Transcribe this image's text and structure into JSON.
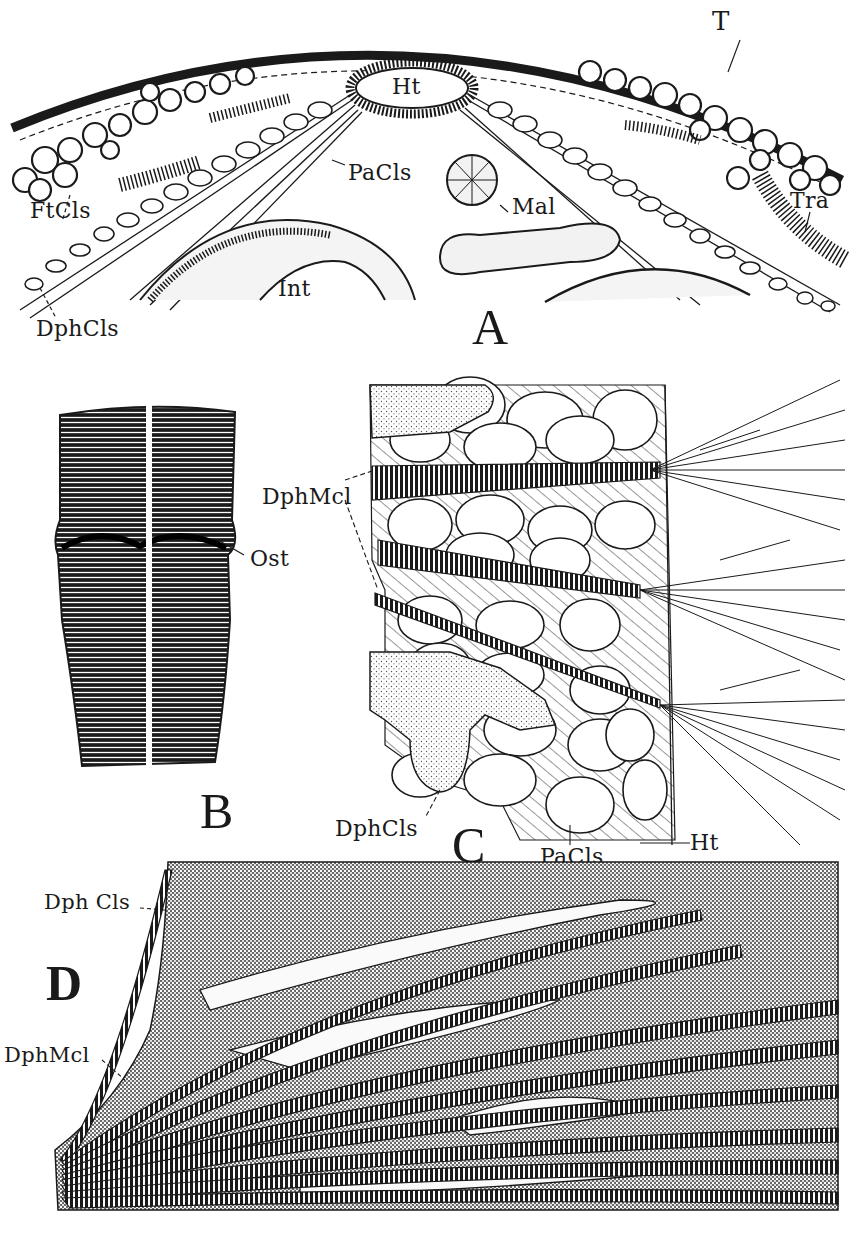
{
  "figure": {
    "panels": [
      {
        "id": "A",
        "letter": "A",
        "labels": {
          "tergum": "T",
          "heart": "Ht",
          "pericardial_cells": "PaCls",
          "fat_cells": "FtCls",
          "malpighian": "Mal",
          "tracheae": "Tra",
          "intestine": "Int",
          "diaphragm_cells": "DphCls"
        }
      },
      {
        "id": "B",
        "letter": "B",
        "labels": {
          "ostium": "Ost"
        }
      },
      {
        "id": "C",
        "letter": "C",
        "labels": {
          "diaphragm_muscle": "DphMcl",
          "diaphragm_cells": "DphCls",
          "pericardial_cells": "PaCls",
          "heart": "Ht"
        }
      },
      {
        "id": "D",
        "letter": "D",
        "labels": {
          "diaphragm_cells": "Dph Cls",
          "diaphragm_muscle": "DphMcl"
        }
      }
    ],
    "colors": {
      "ink": "#1a1a1a",
      "paper": "#ffffff",
      "stipple": "#6a6a6a"
    }
  }
}
